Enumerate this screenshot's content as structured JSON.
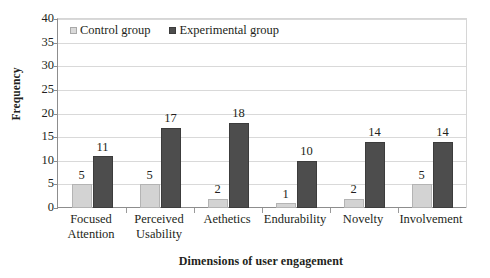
{
  "chart_data": {
    "type": "bar",
    "title": "",
    "xlabel": "Dimensions of user engagement",
    "ylabel": "Frequency",
    "categories": [
      "Focused Attention",
      "Perceived Usability",
      "Aethetics",
      "Endurability",
      "Novelty",
      "Involvement"
    ],
    "category_lines": [
      [
        "Focused",
        "Attention"
      ],
      [
        "Perceived",
        "Usability"
      ],
      [
        "Aethetics",
        ""
      ],
      [
        "Endurability",
        ""
      ],
      [
        "Novelty",
        ""
      ],
      [
        "Involvement",
        ""
      ]
    ],
    "series": [
      {
        "name": "Control group",
        "color": "#d3d3d3",
        "values": [
          5,
          5,
          2,
          1,
          2,
          5
        ]
      },
      {
        "name": "Experimental group",
        "color": "#4d4d4d",
        "values": [
          11,
          17,
          18,
          10,
          14,
          14
        ]
      }
    ],
    "ylim": [
      0,
      40
    ],
    "ytick_step": 5,
    "yticks": [
      "40",
      "35",
      "30",
      "25",
      "20",
      "15",
      "10",
      "5",
      "0"
    ],
    "grid": true,
    "legend_position": "top-left-inside",
    "data_labels": true
  },
  "legend": {
    "items": [
      {
        "label": "Control group",
        "marker": "square-light-gray"
      },
      {
        "label": "Experimental group",
        "marker": "square-dark-gray"
      }
    ]
  }
}
